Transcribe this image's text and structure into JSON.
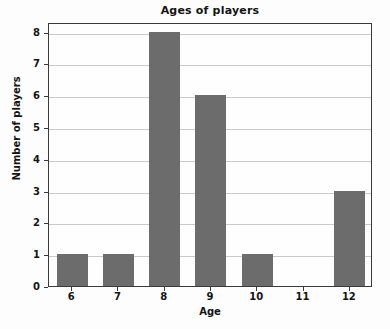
{
  "chart_data": {
    "type": "bar",
    "title": "Ages of players",
    "xlabel": "Age",
    "ylabel": "Number of players",
    "categories": [
      "6",
      "7",
      "8",
      "9",
      "10",
      "11",
      "12"
    ],
    "values": [
      1,
      1,
      8,
      6,
      1,
      0,
      3
    ],
    "xtick_labels": [
      "6",
      "7",
      "8",
      "9",
      "10",
      "11",
      "12"
    ],
    "ytick_labels": [
      "0",
      "1",
      "2",
      "3",
      "4",
      "5",
      "6",
      "7",
      "8"
    ],
    "ylim": [
      0,
      8.3
    ],
    "xlim": [
      5.5,
      12.5
    ],
    "grid": true,
    "grid_axis": "y",
    "legend": false,
    "bar_color": "#6c6c6c",
    "background_color": "#fdfdfd",
    "axis_color": "#3a3a3a",
    "gridline_color": "#c9c9c9"
  }
}
